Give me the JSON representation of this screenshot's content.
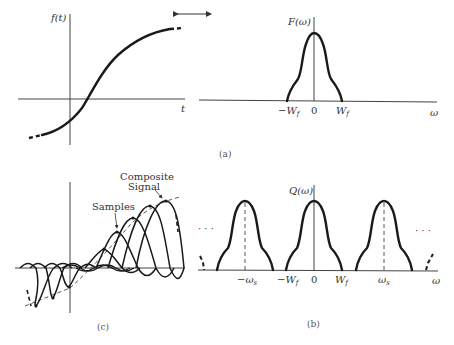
{
  "figure": {
    "panel_a_left": {
      "y_label": "f(t)",
      "x_label": "t"
    },
    "panel_a_right": {
      "y_label": "F(ω)",
      "x_label": "ω",
      "ticks": [
        "−W",
        "0",
        "W"
      ],
      "tick_subscript": "f"
    },
    "caption_a": "(a)",
    "panel_c": {
      "annotation_composite_line1": "Composite",
      "annotation_composite_line2": "Signal",
      "annotation_samples": "Samples",
      "caption": "(c)"
    },
    "panel_b": {
      "y_label": "Q(ω)",
      "x_label": "ω",
      "ticks": [
        "−ω",
        "−W",
        "0",
        "W",
        "ω"
      ],
      "tick_subscripts": [
        "s",
        "f",
        "",
        "f",
        "s"
      ],
      "ellipsis_left": "· · ·",
      "ellipsis_right": "· · ·",
      "caption": "(b)"
    },
    "colors": {
      "ink": "#1a1a1a",
      "axis": "#444444",
      "background": "#ffffff"
    }
  }
}
